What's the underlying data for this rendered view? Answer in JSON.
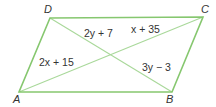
{
  "figure": {
    "shape": "parallelogram",
    "line_color": "#86c76f",
    "diagonal_color": "#a9d89a",
    "vertices": [
      {
        "name": "A",
        "label": "A",
        "x": 19,
        "y": 92,
        "lx": 13,
        "ly": 103
      },
      {
        "name": "B",
        "label": "B",
        "x": 172,
        "y": 92,
        "lx": 166,
        "ly": 103
      },
      {
        "name": "C",
        "label": "C",
        "x": 203,
        "y": 17,
        "lx": 201,
        "ly": 13
      },
      {
        "name": "D",
        "label": "D",
        "x": 50,
        "y": 18,
        "lx": 44,
        "ly": 13
      }
    ],
    "segment_labels": [
      {
        "segment": "DE",
        "text": "2y + 7",
        "x": 84,
        "y": 37
      },
      {
        "segment": "CE",
        "text": "x + 35",
        "x": 131,
        "y": 33
      },
      {
        "segment": "AE",
        "text": "2x + 15",
        "x": 39,
        "y": 66
      },
      {
        "segment": "BE",
        "text": "3y − 3",
        "x": 142,
        "y": 71
      }
    ]
  }
}
